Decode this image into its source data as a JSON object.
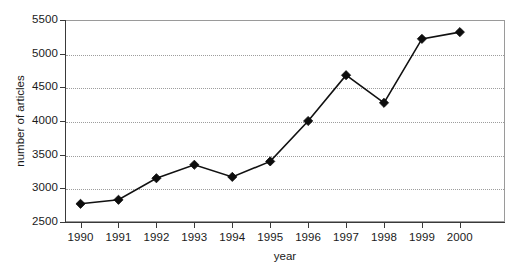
{
  "chart_data": {
    "type": "line",
    "title": "",
    "xlabel": "year",
    "ylabel": "number of articles",
    "categories": [
      "1990",
      "1991",
      "1992",
      "1993",
      "1994",
      "1995",
      "1996",
      "1997",
      "1998",
      "1999",
      "2000"
    ],
    "x": [
      1990,
      1991,
      1992,
      1993,
      1994,
      1995,
      1996,
      1997,
      1998,
      1999,
      2000
    ],
    "values": [
      2770,
      2830,
      3150,
      3350,
      3170,
      3400,
      4000,
      4680,
      4270,
      5220,
      5320
    ],
    "series": [
      {
        "name": "number of articles",
        "values": [
          2770,
          2830,
          3150,
          3350,
          3170,
          3400,
          4000,
          4680,
          4270,
          5220,
          5320
        ]
      }
    ],
    "ylim": [
      2500,
      5500
    ],
    "xlim": [
      1989.5,
      2000.5
    ],
    "yticks": [
      2500,
      3000,
      3500,
      4000,
      4500,
      5000,
      5500
    ],
    "ytick_labels": [
      "2500",
      "3000",
      "3500",
      "4000",
      "4500",
      "5000",
      "5500"
    ],
    "xticks": [
      1990,
      1991,
      1992,
      1993,
      1994,
      1995,
      1996,
      1997,
      1998,
      1999,
      2000
    ],
    "xtick_labels": [
      "1990",
      "1991",
      "1992",
      "1993",
      "1994",
      "1995",
      "1996",
      "1997",
      "1998",
      "1999",
      "2000"
    ],
    "grid": "horizontal-dotted",
    "legend": "none",
    "marker": "filled-diamond",
    "line_color": "#111111",
    "marker_color": "#0d0d0d",
    "grid_color": "#9d9d9d",
    "axis_color": "#3a3a3a",
    "background": "#ffffff"
  }
}
